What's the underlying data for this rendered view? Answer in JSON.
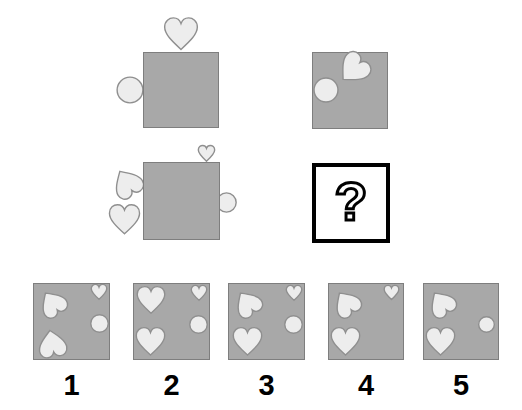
{
  "puzzle": {
    "question_mark": "?",
    "colors": {
      "background": "#ffffff",
      "square_fill": "#a8a8a8",
      "square_border": "#7e7e7e",
      "shape_fill": "#ededed",
      "shape_stroke": "#8f8f8f",
      "question_box_border": "#000000",
      "label_color": "#000000"
    },
    "option_labels": [
      "1",
      "2",
      "3",
      "4",
      "5"
    ],
    "cells": [
      {
        "id": "stimulus-top-left",
        "x": 143,
        "y": 52,
        "w": 76,
        "h": 76,
        "interactable": false,
        "shapes": [
          {
            "type": "heart",
            "x": 162,
            "y": 15,
            "w": 38,
            "h": 40,
            "rotate": 0,
            "layer": "behind"
          },
          {
            "type": "circle",
            "x": 116,
            "y": 76,
            "w": 28,
            "h": 28,
            "rotate": 0,
            "layer": "behind"
          }
        ]
      },
      {
        "id": "stimulus-top-right",
        "x": 312,
        "y": 52,
        "w": 76,
        "h": 77,
        "interactable": false,
        "shapes": [
          {
            "type": "circle",
            "x": 313,
            "y": 77,
            "w": 26,
            "h": 26,
            "rotate": 0,
            "layer": "inside"
          },
          {
            "type": "heart",
            "x": 335,
            "y": 52,
            "w": 35,
            "h": 36,
            "rotate": 45,
            "layer": "inside"
          }
        ]
      },
      {
        "id": "stimulus-middle-left",
        "x": 143,
        "y": 162,
        "w": 77,
        "h": 78,
        "interactable": false,
        "shapes": [
          {
            "type": "heart",
            "x": 197,
            "y": 144,
            "w": 19,
            "h": 20,
            "rotate": 0,
            "layer": "behind"
          },
          {
            "type": "heart",
            "x": 110,
            "y": 164,
            "w": 33,
            "h": 36,
            "rotate": 148,
            "layer": "behind"
          },
          {
            "type": "heart",
            "x": 107,
            "y": 203,
            "w": 35,
            "h": 35,
            "rotate": 0,
            "layer": "behind"
          },
          {
            "type": "circle",
            "x": 216,
            "y": 192,
            "w": 21,
            "h": 21,
            "rotate": 0,
            "layer": "behind"
          }
        ]
      },
      {
        "id": "option-1-square",
        "x": 33,
        "y": 283,
        "w": 77,
        "h": 77,
        "interactable": true,
        "shapes": [
          {
            "type": "heart",
            "x": 37,
            "y": 285,
            "w": 30,
            "h": 35,
            "rotate": 145,
            "layer": "inside"
          },
          {
            "type": "heart",
            "x": 36,
            "y": 326,
            "w": 32,
            "h": 33,
            "rotate": 170,
            "layer": "inside"
          },
          {
            "type": "heart",
            "x": 90,
            "y": 283,
            "w": 18,
            "h": 19,
            "rotate": 0,
            "layer": "inside"
          },
          {
            "type": "circle",
            "x": 90,
            "y": 314,
            "w": 19,
            "h": 19,
            "rotate": 0,
            "layer": "inside"
          }
        ]
      },
      {
        "id": "option-2-square",
        "x": 133,
        "y": 283,
        "w": 77,
        "h": 77,
        "interactable": true,
        "shapes": [
          {
            "type": "heart",
            "x": 135,
            "y": 284,
            "w": 32,
            "h": 34,
            "rotate": 0,
            "layer": "inside"
          },
          {
            "type": "heart",
            "x": 134,
            "y": 326,
            "w": 33,
            "h": 33,
            "rotate": 0,
            "layer": "inside"
          },
          {
            "type": "heart",
            "x": 190,
            "y": 284,
            "w": 18,
            "h": 19,
            "rotate": 0,
            "layer": "inside"
          },
          {
            "type": "circle",
            "x": 189,
            "y": 315,
            "w": 19,
            "h": 19,
            "rotate": 0,
            "layer": "inside"
          }
        ]
      },
      {
        "id": "option-3-square",
        "x": 228,
        "y": 283,
        "w": 77,
        "h": 77,
        "interactable": true,
        "shapes": [
          {
            "type": "heart",
            "x": 232,
            "y": 285,
            "w": 30,
            "h": 35,
            "rotate": 145,
            "layer": "inside"
          },
          {
            "type": "heart",
            "x": 231,
            "y": 326,
            "w": 33,
            "h": 33,
            "rotate": 0,
            "layer": "inside"
          },
          {
            "type": "heart",
            "x": 285,
            "y": 284,
            "w": 18,
            "h": 19,
            "rotate": 0,
            "layer": "inside"
          },
          {
            "type": "circle",
            "x": 284,
            "y": 315,
            "w": 19,
            "h": 19,
            "rotate": 0,
            "layer": "inside"
          }
        ]
      },
      {
        "id": "option-4-square",
        "x": 328,
        "y": 283,
        "w": 76,
        "h": 77,
        "interactable": true,
        "shapes": [
          {
            "type": "heart",
            "x": 331,
            "y": 285,
            "w": 30,
            "h": 35,
            "rotate": 145,
            "layer": "inside"
          },
          {
            "type": "heart",
            "x": 329,
            "y": 326,
            "w": 33,
            "h": 33,
            "rotate": 0,
            "layer": "inside"
          },
          {
            "type": "heart",
            "x": 383,
            "y": 284,
            "w": 17,
            "h": 18,
            "rotate": 0,
            "layer": "inside"
          }
        ]
      },
      {
        "id": "option-5-square",
        "x": 423,
        "y": 283,
        "w": 76,
        "h": 77,
        "interactable": true,
        "shapes": [
          {
            "type": "heart",
            "x": 426,
            "y": 285,
            "w": 30,
            "h": 35,
            "rotate": 145,
            "layer": "inside"
          },
          {
            "type": "heart",
            "x": 424,
            "y": 326,
            "w": 33,
            "h": 33,
            "rotate": 0,
            "layer": "inside"
          },
          {
            "type": "circle",
            "x": 478,
            "y": 316,
            "w": 17,
            "h": 17,
            "rotate": 0,
            "layer": "inside"
          }
        ]
      }
    ],
    "question_box": {
      "x": 312,
      "y": 163,
      "w": 78,
      "h": 80
    }
  }
}
